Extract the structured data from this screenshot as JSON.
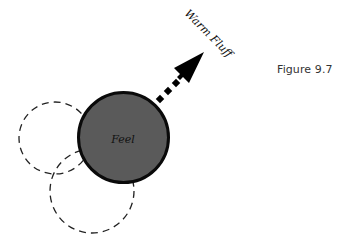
{
  "figure": {
    "label": "Figure 9.7"
  },
  "center_node": {
    "label": "Feel",
    "fill": "#5a5a5a",
    "stroke": "#0a0a0a"
  },
  "arrow": {
    "label": "Warm Fluff",
    "color": "#000000",
    "style": "dashed shaft with solid head"
  },
  "ghost_nodes": [
    {
      "id": "dashed-circle-left",
      "style": "dashed",
      "label": ""
    },
    {
      "id": "dashed-circle-bottom",
      "style": "dashed",
      "label": ""
    }
  ]
}
